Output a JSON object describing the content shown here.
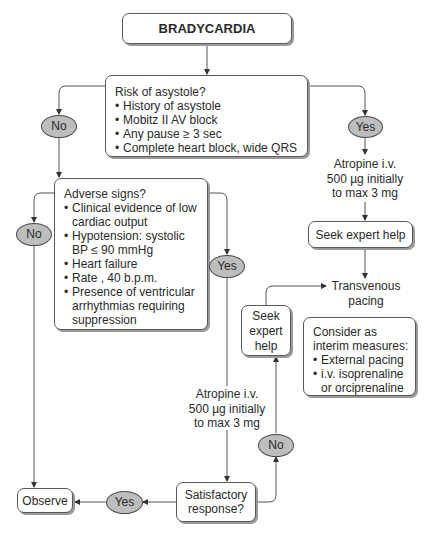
{
  "title": "BRADYCARDIA",
  "risk": {
    "question": "Risk of asystole?",
    "items": [
      "History of asystole",
      "Mobitz II AV block",
      "Any pause ≥ 3 sec",
      "Complete heart block, wide QRS"
    ]
  },
  "risk_no": "No",
  "risk_yes": "Yes",
  "atropine_right": [
    "Atropine i.v.",
    "500 µg initially",
    "to max 3 mg"
  ],
  "seek_expert_top": "Seek expert help",
  "transvenous": [
    "Transvenous",
    "pacing"
  ],
  "consider": {
    "heading": [
      "Consider as",
      "interim measures:"
    ],
    "items": [
      "External pacing",
      "i.v. isoprenaline",
      "or orciprenaline"
    ]
  },
  "adverse": {
    "question": "Adverse signs?",
    "items": [
      "Clinical evidence of low cardiac output",
      "Hypotension: systolic BP ≤ 90 mmHg",
      "Heart failure",
      "Rate , 40 b.p.m.",
      "Presence of ventricular arrhythmias requiring suppression"
    ]
  },
  "adverse_no": "No",
  "adverse_yes": "Yes",
  "seek_expert_small": [
    "Seek",
    "expert",
    "help"
  ],
  "atropine_mid": [
    "Atropine i.v.",
    "500 µg initially",
    "to max 3 mg"
  ],
  "satisfactory": [
    "Satisfactory",
    "response?"
  ],
  "sat_yes": "Yes",
  "sat_no": "No",
  "observe": "Observe"
}
